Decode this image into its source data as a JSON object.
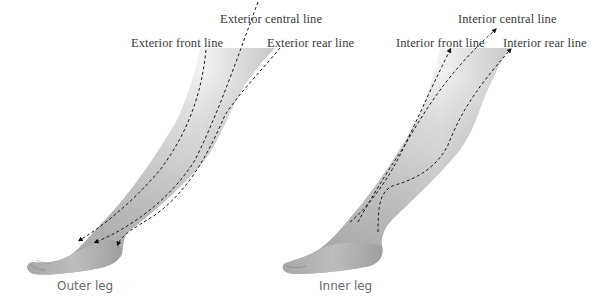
{
  "figure": {
    "panels": [
      {
        "id": "outer",
        "caption": "Outer leg",
        "lines": [
          {
            "label": "Exterior central line"
          },
          {
            "label": "Exterior front line"
          },
          {
            "label": "Exterior rear line"
          }
        ]
      },
      {
        "id": "inner",
        "caption": "Inner leg",
        "lines": [
          {
            "label": "Interior central line"
          },
          {
            "label": "Interior front line"
          },
          {
            "label": "Interior rear line"
          }
        ]
      }
    ],
    "colors": {
      "background": "#ffffff",
      "skin_light": "#f2f2f2",
      "skin_mid": "#c8c8c8",
      "skin_dark": "#8a8a8a",
      "line": "#1a1a1a",
      "label_text": "#3a3a3a",
      "caption_text": "#6a6a6a"
    }
  }
}
